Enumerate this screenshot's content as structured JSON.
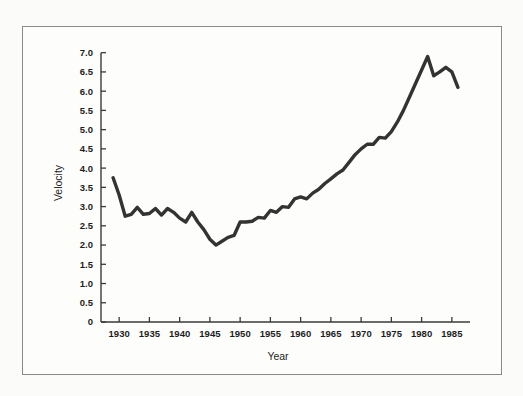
{
  "figure": {
    "background_color": "#fbfbf9",
    "frame_color": "#8a8a8a",
    "line_color": "#333333",
    "axis_color": "#3a3a3a"
  },
  "chart_data": {
    "type": "line",
    "title": "",
    "subtitle": "",
    "xlabel": "Year",
    "ylabel": "Velocity",
    "xlim": [
      1927,
      1988
    ],
    "ylim": [
      0,
      7.2
    ],
    "grid": false,
    "legend": null,
    "legend_position": "none",
    "xticks": [
      1930,
      1935,
      1940,
      1945,
      1950,
      1955,
      1960,
      1965,
      1970,
      1975,
      1980,
      1985
    ],
    "xticklabels": [
      "1930",
      "1935",
      "1940",
      "1945",
      "1950",
      "1955",
      "1960",
      "1965",
      "1970",
      "1975",
      "1980",
      "1985"
    ],
    "yticks": [
      0,
      0.5,
      1.0,
      1.5,
      2.0,
      2.5,
      3.0,
      3.5,
      4.0,
      4.5,
      5.0,
      5.5,
      6.0,
      6.5,
      7.0
    ],
    "yticklabels": [
      "0",
      "0.5",
      "1.0",
      "1.5",
      "2.0",
      "2.5",
      "3.0",
      "3.5",
      "4.0",
      "4.5",
      "5.0",
      "5.5",
      "6.0",
      "6.5",
      "7.0"
    ],
    "series": [
      {
        "name": "Velocity",
        "color": "#333333",
        "x": [
          1929,
          1930,
          1931,
          1932,
          1933,
          1934,
          1935,
          1936,
          1937,
          1938,
          1939,
          1940,
          1941,
          1942,
          1943,
          1944,
          1945,
          1946,
          1947,
          1948,
          1949,
          1950,
          1951,
          1952,
          1953,
          1954,
          1955,
          1956,
          1957,
          1958,
          1959,
          1960,
          1961,
          1962,
          1963,
          1964,
          1965,
          1966,
          1967,
          1968,
          1969,
          1970,
          1971,
          1972,
          1973,
          1974,
          1975,
          1976,
          1977,
          1978,
          1979,
          1980,
          1981,
          1982,
          1983,
          1984,
          1985,
          1986
        ],
        "y": [
          3.75,
          3.3,
          2.75,
          2.8,
          2.98,
          2.8,
          2.82,
          2.95,
          2.78,
          2.95,
          2.85,
          2.7,
          2.6,
          2.85,
          2.6,
          2.4,
          2.15,
          2.0,
          2.1,
          2.2,
          2.25,
          2.6,
          2.6,
          2.62,
          2.72,
          2.7,
          2.9,
          2.85,
          3.0,
          2.98,
          3.2,
          3.25,
          3.2,
          3.35,
          3.45,
          3.6,
          3.72,
          3.85,
          3.95,
          4.15,
          4.35,
          4.5,
          4.62,
          4.62,
          4.8,
          4.78,
          4.95,
          5.2,
          5.5,
          5.85,
          6.2,
          6.55,
          6.9,
          6.4,
          6.5,
          6.62,
          6.5,
          6.1
        ]
      }
    ]
  }
}
